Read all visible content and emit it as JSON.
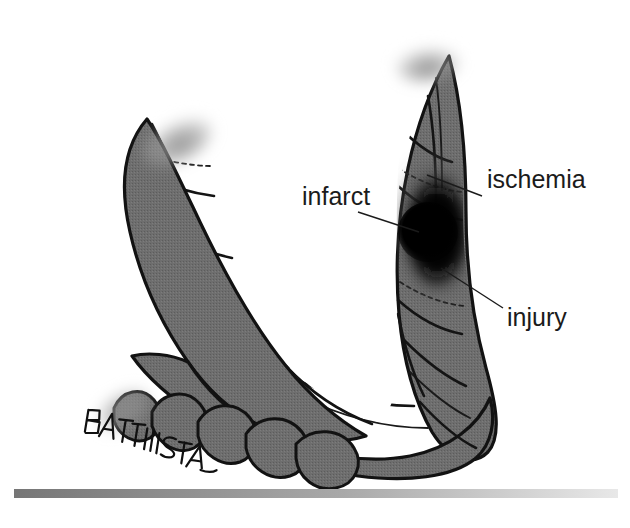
{
  "figure": {
    "background_color": "#ffffff",
    "muscle_color": "#6e6e6e",
    "outline_color": "#121212"
  },
  "labels": [
    {
      "id": "infarct",
      "text": "infarct",
      "x": 302,
      "y": 205,
      "leader_from": [
        358,
        212
      ],
      "leader_to": [
        419,
        232
      ],
      "zone_color": "#000000"
    },
    {
      "id": "ischemia",
      "text": "ischemia",
      "x": 487,
      "y": 188,
      "leader_from": [
        482,
        196
      ],
      "leader_to": [
        427,
        175
      ],
      "zone_color": "#4a4a4a"
    },
    {
      "id": "injury",
      "text": "injury",
      "x": 507,
      "y": 326,
      "leader_from": [
        503,
        308
      ],
      "leader_to": [
        441,
        268
      ],
      "zone_color": "#141414"
    }
  ],
  "signature": {
    "text": "BATTISTA",
    "x": 92,
    "y": 432
  },
  "footer_bar": {
    "x": 14,
    "y": 489,
    "width": 604,
    "height": 9,
    "color_start": "#767676",
    "color_end": "#e8e8e8"
  },
  "lesion_zones": [
    {
      "name": "ischemia",
      "order": 1,
      "color": "#4a4a4a"
    },
    {
      "name": "injury",
      "order": 2,
      "color": "#141414"
    },
    {
      "name": "infarct",
      "order": 3,
      "color": "#000000"
    }
  ]
}
